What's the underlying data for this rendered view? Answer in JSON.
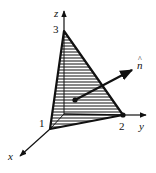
{
  "figure": {
    "type": "3d-coordinate-diagram",
    "axes": {
      "x": {
        "label": "x"
      },
      "y": {
        "label": "y"
      },
      "z": {
        "label": "z"
      }
    },
    "intercepts": {
      "x": "1",
      "y": "2",
      "z": "3"
    },
    "normal_vector": {
      "label": "n",
      "hat": "^"
    },
    "colors": {
      "stroke": "#111111",
      "background": "#ffffff"
    }
  }
}
